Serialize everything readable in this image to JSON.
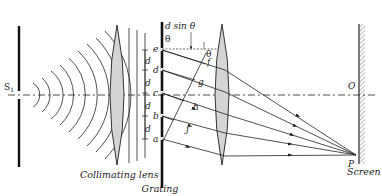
{
  "diagram": {
    "type": "diffraction-grating-optical-setup",
    "labels": {
      "source": "S",
      "source_sub": "1",
      "collimating_lens": "Collimating lens",
      "grating": "Grating",
      "screen": "Screen",
      "path_difference": "d sin θ",
      "theta_top": "θ",
      "theta_right": "θ",
      "screen_center": "O",
      "screen_point": "P",
      "slit_e": "e",
      "slit_d": "d",
      "slit_c": "c",
      "slit_b": "b",
      "slit_a": "a",
      "foot_f": "f",
      "foot_g": "g",
      "foot_h": "h",
      "foot_j": "j",
      "spacing": [
        "d",
        "d",
        "d",
        "d"
      ]
    },
    "colors": {
      "line": "#222222",
      "lens_fill": "#d4d4d4"
    }
  }
}
